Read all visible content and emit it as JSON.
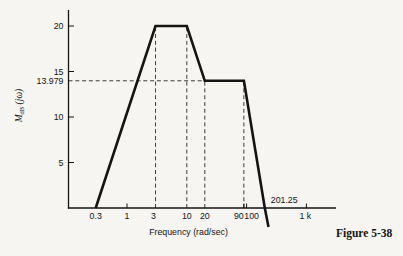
{
  "figure": {
    "caption": "Figure 5-38"
  },
  "chart_data": {
    "type": "line",
    "title": "",
    "xlabel": "Frequency (rad/sec)",
    "ylabel": "M dB (jω)",
    "ylabel_parts": {
      "symbol": "M",
      "subscript": "dB",
      "argument": " (jω)"
    },
    "x_scale": "log",
    "y_scale": "linear",
    "xlim": [
      0.2,
      1400
    ],
    "ylim": [
      -2.5,
      22
    ],
    "grid": "off",
    "legend": "none",
    "y_axis": {
      "ticks": [
        {
          "label": "20",
          "db": 20
        },
        {
          "label": "15",
          "db": 15
        },
        {
          "label": "10",
          "db": 10
        },
        {
          "label": "5",
          "db": 5
        }
      ],
      "reference_label": {
        "label": "13.979",
        "db": 13.979
      }
    },
    "x_axis": {
      "ticks": [
        {
          "label": "0.3",
          "freq": 0.3,
          "tick_mark": false,
          "label_dx": 0
        },
        {
          "label": "1",
          "freq": 1,
          "tick_mark": true,
          "label_dx": 0
        },
        {
          "label": "3",
          "freq": 3,
          "tick_mark": false,
          "label_dx": -2
        },
        {
          "label": "10",
          "freq": 10,
          "tick_mark": false,
          "label_dx": 0
        },
        {
          "label": "20",
          "freq": 20,
          "tick_mark": false,
          "label_dx": 0
        },
        {
          "label": "90",
          "freq": 90,
          "tick_mark": true,
          "label_dx": -5
        },
        {
          "label": "100",
          "freq": 100,
          "tick_mark": true,
          "label_dx": 5
        },
        {
          "label": "1 k",
          "freq": 1000,
          "tick_mark": true,
          "label_dx": -1
        }
      ]
    },
    "series": [
      {
        "name": "asymptotic-magnitude",
        "points": [
          {
            "freq": 0.3,
            "db": 0
          },
          {
            "freq": 3,
            "db": 20
          },
          {
            "freq": 10,
            "db": 20
          },
          {
            "freq": 20,
            "db": 13.979
          },
          {
            "freq": 90,
            "db": 13.979
          },
          {
            "freq": 201.25,
            "db": 0
          },
          {
            "freq": 232,
            "db": -2.1
          }
        ]
      }
    ],
    "guides": {
      "horizontal": {
        "db": 13.979,
        "to_freq": 20
      },
      "vertical": [
        {
          "freq": 3,
          "to_db": 20
        },
        {
          "freq": 10,
          "to_db": 20
        },
        {
          "freq": 20,
          "to_db": 13.979
        },
        {
          "freq": 90,
          "to_db": 13.979
        }
      ]
    },
    "annotations": [
      {
        "text": "201.25",
        "freq": 201.25,
        "db": 0
      }
    ]
  },
  "colors": {
    "ink": "#141414",
    "dash": "#3c3c3c",
    "paper": "#f6f5f1"
  }
}
